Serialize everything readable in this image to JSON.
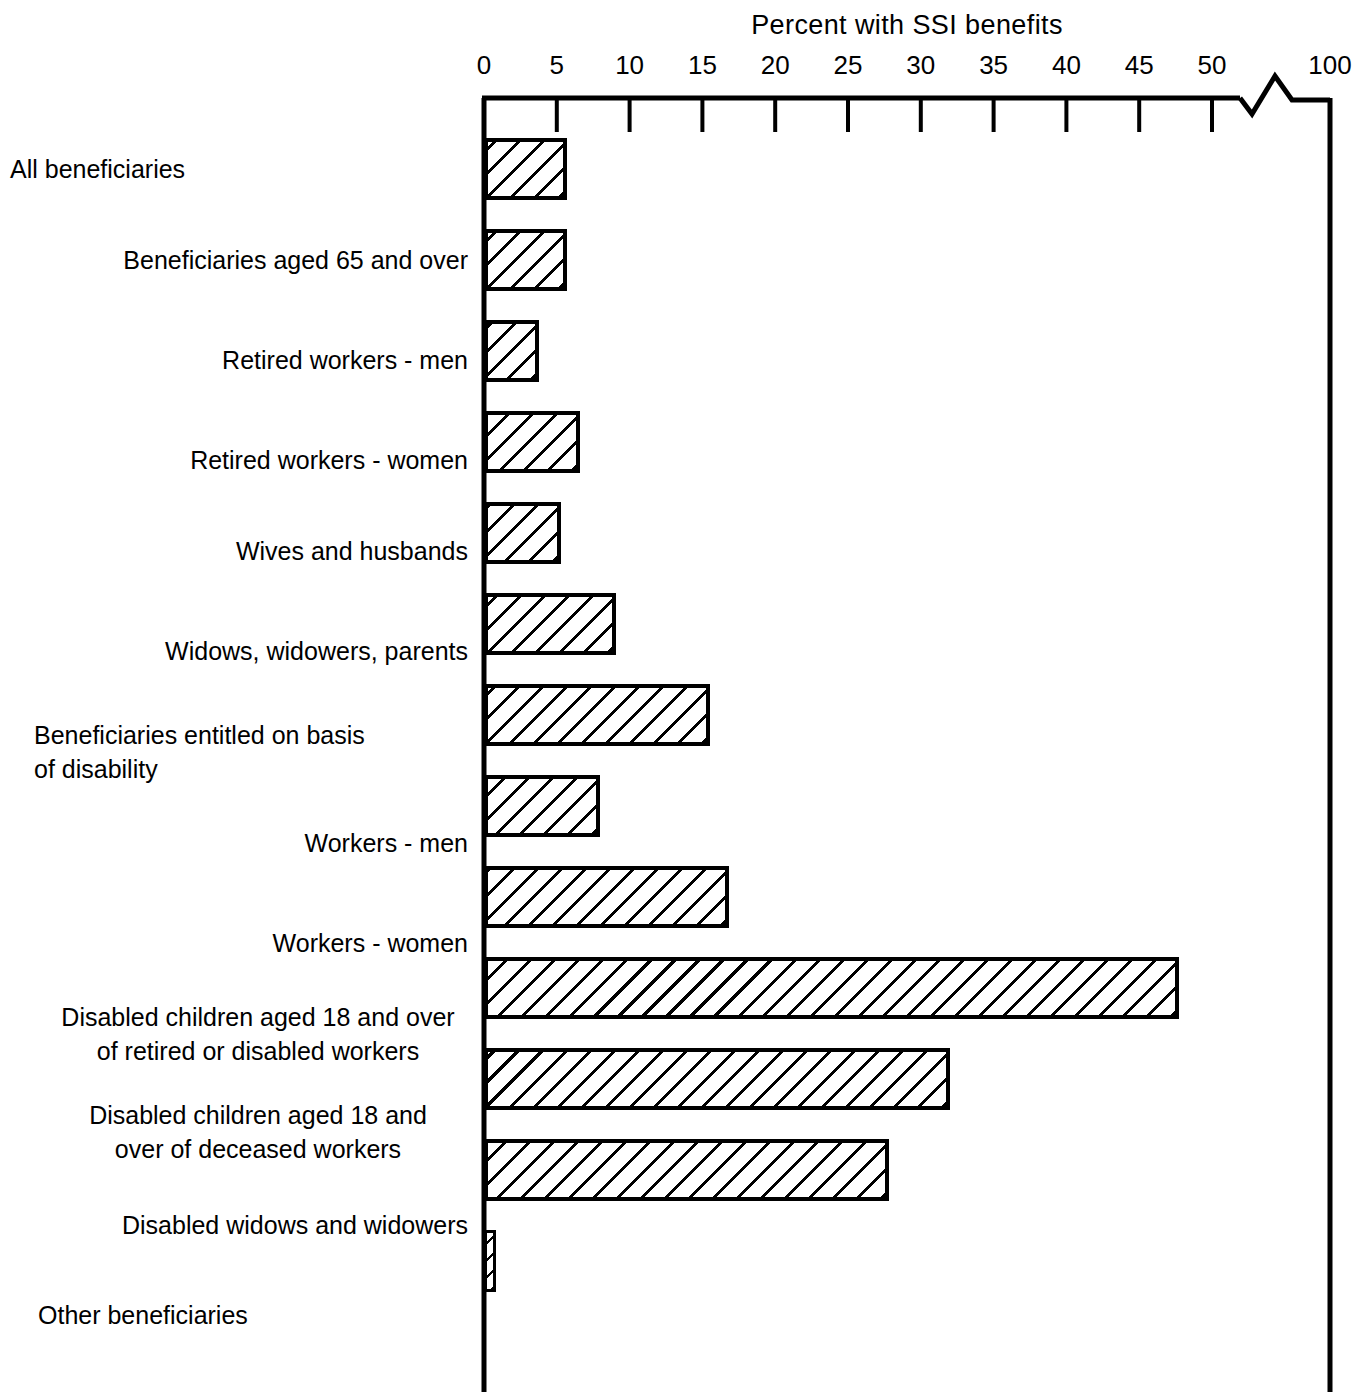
{
  "chart_data": {
    "type": "bar",
    "orientation": "horizontal",
    "title": "Percent with SSI benefits",
    "xlabel": "Percent with SSI benefits",
    "ylabel": "",
    "xlim": [
      0,
      50
    ],
    "grid": false,
    "legend": null,
    "axis_break": {
      "present": true,
      "between": [
        50,
        100
      ],
      "symbol": "zigzag"
    },
    "tick_labels": [
      "0",
      "5",
      "10",
      "15",
      "20",
      "25",
      "30",
      "35",
      "40",
      "45",
      "50",
      "100"
    ],
    "tick_values": [
      0,
      5,
      10,
      15,
      20,
      25,
      30,
      35,
      40,
      45,
      50,
      100
    ],
    "categories": [
      "All beneficiaries",
      "Beneficiaries aged 65 and over",
      "Retired workers - men",
      "Retired workers - women",
      "Wives and husbands",
      "Widows, widowers, parents",
      "Beneficiaries entitled on basis\nof disability",
      "Workers - men",
      "Workers - women",
      "Disabled children aged 18 and over\nof retired or disabled workers",
      "Disabled children aged 18 and\nover of deceased workers",
      "Disabled widows and widowers",
      "Other beneficiaries"
    ],
    "values": [
      5.7,
      5.7,
      3.8,
      6.6,
      5.3,
      9.1,
      15.5,
      8.0,
      16.8,
      47.7,
      32.0,
      27.8,
      0.8
    ]
  },
  "labels": {
    "items": [
      {
        "text": "All beneficiaries",
        "align": "left",
        "left": 10,
        "right": 0,
        "top": 152,
        "width": 450
      },
      {
        "text": "Beneficiaries aged 65 and over",
        "align": "right",
        "left": 0,
        "right": 0,
        "top": 243,
        "width": 393
      },
      {
        "text": "Retired workers - men",
        "align": "right",
        "left": 0,
        "right": 0,
        "top": 343,
        "width": 322
      },
      {
        "text": "Retired workers - women",
        "align": "right",
        "left": 0,
        "right": 0,
        "top": 443,
        "width": 351
      },
      {
        "text": "Wives and husbands",
        "align": "right",
        "left": 0,
        "right": 0,
        "top": 534,
        "width": 310
      },
      {
        "text": "Widows, widowers, parents",
        "align": "right",
        "left": 0,
        "right": 0,
        "top": 634,
        "width": 380
      },
      {
        "text": "Beneficiaries entitled on basis\nof disability",
        "align": "left",
        "left": 34,
        "right": 0,
        "top": 718,
        "width": 420
      },
      {
        "text": "Workers - men",
        "align": "right",
        "left": 0,
        "right": 0,
        "top": 826,
        "width": 240
      },
      {
        "text": "Workers - women",
        "align": "right",
        "left": 0,
        "right": 0,
        "top": 926,
        "width": 265
      },
      {
        "text": "Disabled children aged 18 and over\nof retired or disabled workers",
        "align": "center",
        "left": 48,
        "right": 0,
        "top": 1000,
        "width": 420
      },
      {
        "text": "Disabled children aged 18 and\nover of deceased workers",
        "align": "center",
        "left": 48,
        "right": 0,
        "top": 1098,
        "width": 420
      },
      {
        "text": "Disabled widows and widowers",
        "align": "right",
        "left": 0,
        "right": 0,
        "top": 1208,
        "width": 417
      },
      {
        "text": "Other beneficiaries",
        "align": "left",
        "left": 38,
        "right": 0,
        "top": 1298,
        "width": 400
      }
    ]
  }
}
